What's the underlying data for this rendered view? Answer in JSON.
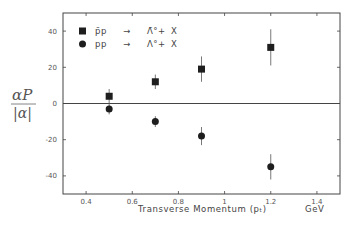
{
  "chart_data": {
    "type": "scatter",
    "title": "",
    "xlabel": "Transverse Momentum (pₜ)",
    "xunit": "GeV",
    "ylabel_numerator": "αP",
    "ylabel_denominator": "|α|",
    "xlim": [
      0.3,
      1.5
    ],
    "ylim": [
      -50,
      50
    ],
    "xticks": [
      0.4,
      0.6,
      0.8,
      1,
      1.2,
      1.4
    ],
    "xtick_labels": [
      "0.4",
      "0.6",
      "0.8",
      "1",
      "1.2",
      "1.4"
    ],
    "yticks": [
      40,
      20,
      0,
      -20,
      -40
    ],
    "ytick_labels": [
      "40",
      "20",
      "0",
      "-20",
      "-40"
    ],
    "grid": false,
    "zero_line": true,
    "legend_position": "upper-left",
    "series": [
      {
        "name": "p̄p → Λ̄° + X",
        "legend_parts": [
          "p̄p",
          "→",
          "Λ̄°",
          "+",
          "X"
        ],
        "marker": "square",
        "x": [
          0.5,
          0.7,
          0.9,
          1.2
        ],
        "y": [
          4,
          12,
          19,
          31
        ],
        "yerr": [
          4,
          4,
          7,
          10
        ]
      },
      {
        "name": "pp → Λ° + X",
        "legend_parts": [
          "pp",
          "→",
          "Λ°",
          "+",
          "X"
        ],
        "marker": "circle",
        "x": [
          0.5,
          0.7,
          0.9,
          1.2
        ],
        "y": [
          -3,
          -10,
          -18,
          -35
        ],
        "yerr": [
          3,
          3,
          5,
          7
        ]
      }
    ]
  },
  "colors": {
    "axis": "#444444",
    "marker": "#1e1e1e",
    "text": "#4a4a4a",
    "background": "#ffffff"
  }
}
